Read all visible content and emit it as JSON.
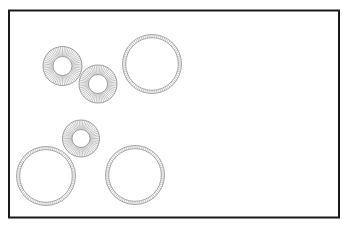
{
  "canvas": {
    "background": "#ffffff",
    "frame_color": "#1a1a1a",
    "stroke_color": "#8a8a8a"
  },
  "shapes": [
    {
      "id": "ring-a",
      "kind": "radial-ring",
      "label": ""
    },
    {
      "id": "ring-b",
      "kind": "radial-ring",
      "label": ""
    },
    {
      "id": "circle-c",
      "kind": "segmented-circle",
      "label": ""
    },
    {
      "id": "ring-d",
      "kind": "radial-ring",
      "label": ""
    },
    {
      "id": "circle-e",
      "kind": "segmented-circle",
      "label": ""
    },
    {
      "id": "circle-f",
      "kind": "segmented-circle",
      "label": ""
    }
  ],
  "counts": {
    "radial_rings": 3,
    "segmented_circles": 3
  }
}
